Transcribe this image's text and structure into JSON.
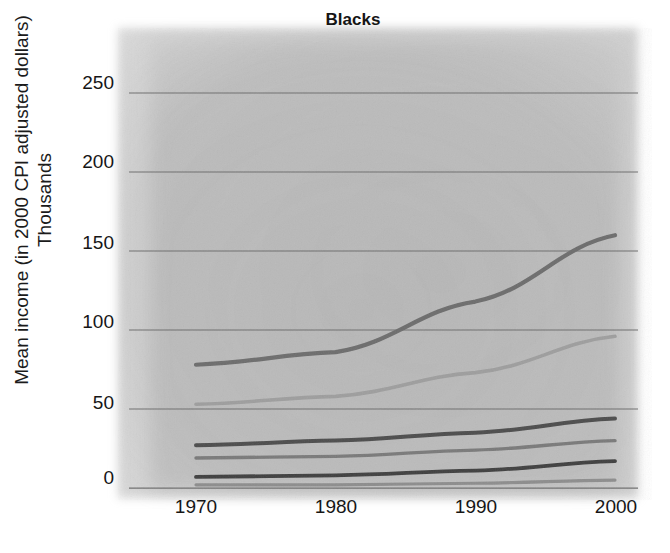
{
  "chart_data": {
    "type": "line",
    "title": "Blacks",
    "xlabel": "",
    "ylabel": "Mean income (in 2000 CPI adjusted dollars)",
    "ylabel_line2": "Thousands",
    "x": [
      1970,
      1980,
      1990,
      2000
    ],
    "xticklabels": [
      "1970",
      "1980",
      "1990",
      "2000"
    ],
    "yticklabels": [
      "0",
      "50",
      "100",
      "150",
      "200",
      "250"
    ],
    "ytickvalues": [
      0,
      50,
      100,
      150,
      200,
      250
    ],
    "xlim": [
      1970,
      2000
    ],
    "ylim": [
      0,
      255
    ],
    "grid": "horizontal",
    "legend": "none",
    "series": [
      {
        "name": "Top 5 percent",
        "color": "#6d6d6d",
        "width": 4.2,
        "values": [
          78,
          86,
          118,
          160
        ]
      },
      {
        "name": "Highest fifth",
        "color": "#9e9e9e",
        "width": 3.6,
        "values": [
          53,
          58,
          73,
          96
        ]
      },
      {
        "name": "Fourth fifth",
        "color": "#4d4d4d",
        "width": 4.0,
        "values": [
          27,
          30,
          35,
          44
        ]
      },
      {
        "name": "Third fifth",
        "color": "#7a7a7a",
        "width": 3.4,
        "values": [
          19,
          20,
          24,
          30
        ]
      },
      {
        "name": "Second fifth",
        "color": "#3f3f3f",
        "width": 3.8,
        "values": [
          7,
          8,
          11,
          17
        ]
      },
      {
        "name": "Lowest fifth",
        "color": "#8d8d8d",
        "width": 3.2,
        "values": [
          2,
          2,
          3,
          5
        ]
      }
    ]
  },
  "axis": {
    "gridline_color": "#6f6f6f",
    "tick_text_color": "#161616"
  }
}
